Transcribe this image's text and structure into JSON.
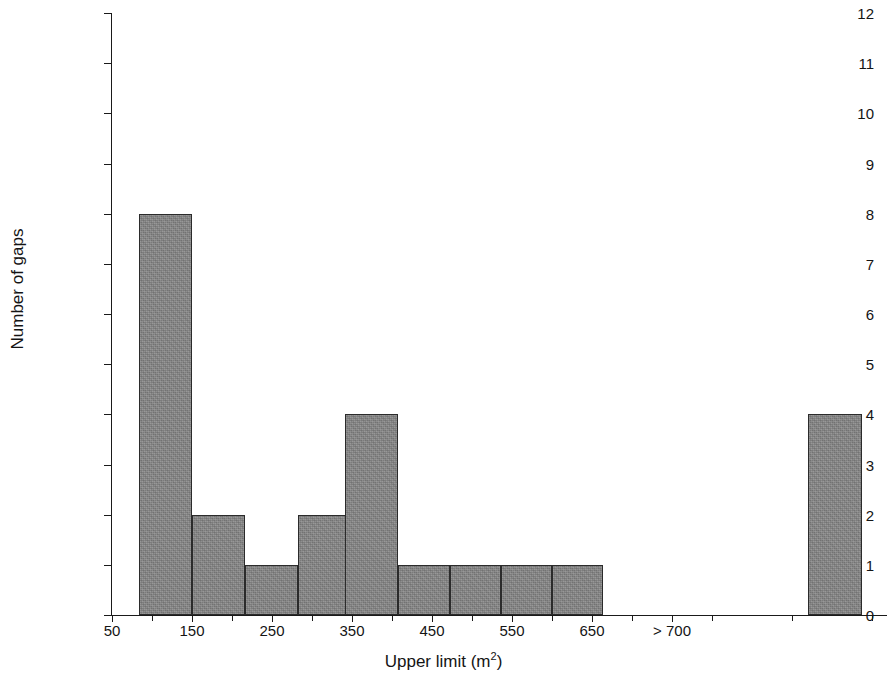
{
  "chart_data": {
    "type": "bar",
    "title": "",
    "subtitle": "",
    "xlabel": "Upper limit (m²)",
    "xlabel_text": "Upper limit (m",
    "xlabel_sup": "2",
    "xlabel_tail": ")",
    "ylabel": "Number of gaps",
    "xlim": [
      0,
      775
    ],
    "ylim": [
      0,
      12
    ],
    "grid": false,
    "legend": null,
    "orientation": "vertical",
    "bar_style": {
      "fill": "#858585",
      "edge": "#2b2b2b",
      "texture": "noisy-gray"
    },
    "x_tick_labels": [
      "50",
      "150",
      "250",
      "350",
      "450",
      "550",
      "650",
      "> 700"
    ],
    "x_tick_positions_px": [
      112,
      192,
      272,
      352,
      432,
      512,
      592,
      672
    ],
    "y_tick_labels": [
      "0",
      "1",
      "2",
      "3",
      "4",
      "5",
      "6",
      "7",
      "8",
      "9",
      "10",
      "11",
      "12"
    ],
    "y_tick_values": [
      0,
      1,
      2,
      3,
      4,
      5,
      6,
      7,
      8,
      9,
      10,
      11,
      12
    ],
    "categories": [
      "100",
      "150",
      "200",
      "250",
      "300",
      "350",
      "400",
      "450",
      "500",
      "550",
      "600",
      "650",
      "700",
      "> 700"
    ],
    "values": [
      8,
      2,
      1,
      2,
      4,
      1,
      1,
      1,
      1,
      0,
      0,
      0,
      0,
      4
    ],
    "bars": [
      {
        "label": "100",
        "value": 8,
        "x_px": 139,
        "width_px": 53
      },
      {
        "label": "150",
        "value": 2,
        "x_px": 192,
        "width_px": 53
      },
      {
        "label": "200",
        "value": 1,
        "x_px": 245,
        "width_px": 53
      },
      {
        "label": "250",
        "value": 2,
        "x_px": 298,
        "width_px": 53
      },
      {
        "label": "300",
        "value": 4,
        "x_px": 345,
        "width_px": 53
      },
      {
        "label": "350",
        "value": 1,
        "x_px": 398,
        "width_px": 52
      },
      {
        "label": "400",
        "value": 1,
        "x_px": 450,
        "width_px": 51
      },
      {
        "label": "450",
        "value": 1,
        "x_px": 501,
        "width_px": 51
      },
      {
        "label": "500",
        "value": 1,
        "x_px": 552,
        "width_px": 51
      },
      {
        "label": "> 700",
        "value": 4,
        "x_px": 808,
        "width_px": 54
      }
    ]
  },
  "axes": {
    "y_title": "Number of gaps",
    "x_title_main": "Upper limit (m",
    "x_title_sup": "2",
    "x_title_end": ")"
  }
}
